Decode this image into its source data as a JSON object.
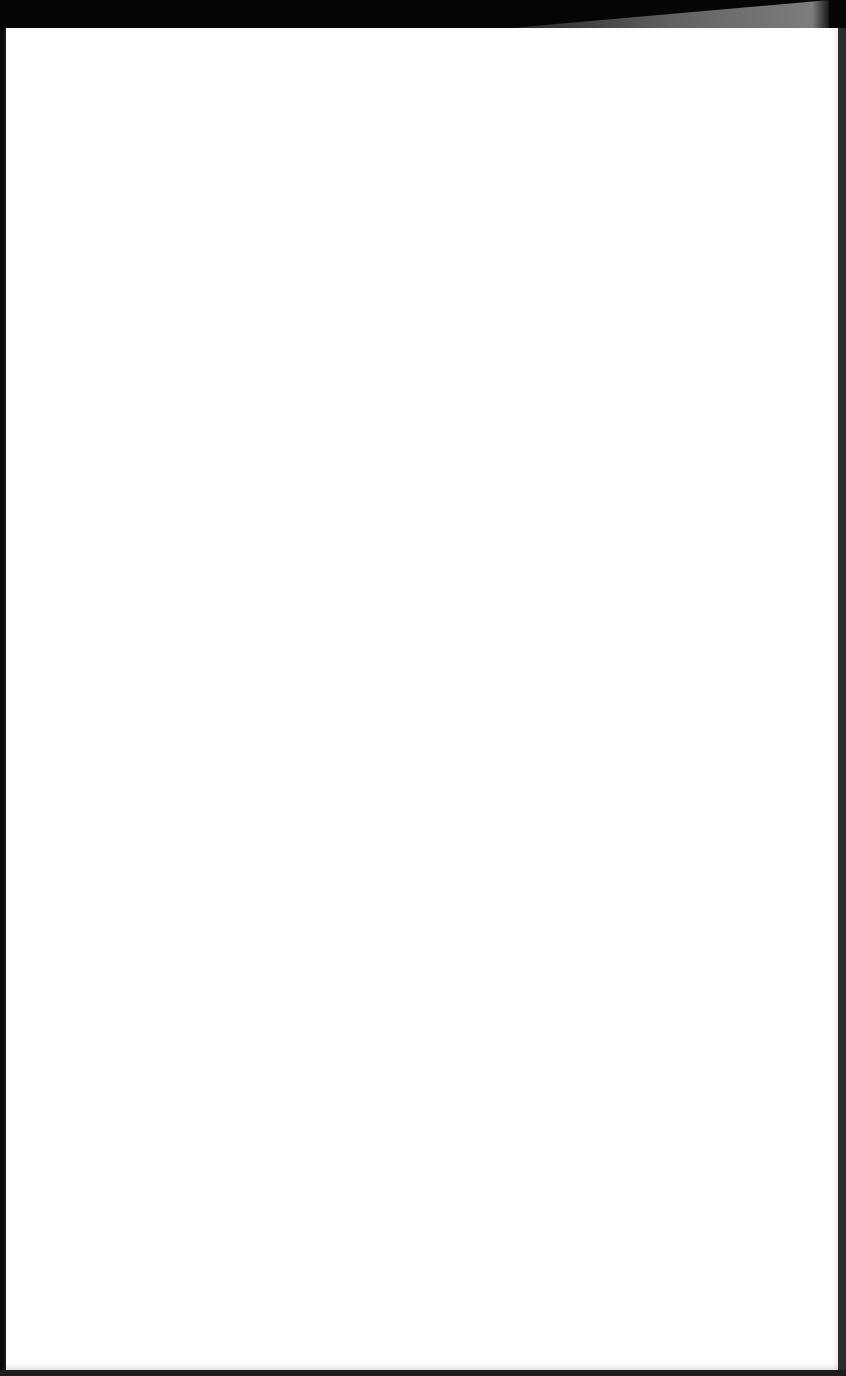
{
  "page": {
    "content_text": "",
    "colors": {
      "background": "#0a0a0a",
      "sheet": "#ffffff",
      "edge": "#2b2b2b",
      "wedge": "#8a8a8a"
    }
  }
}
